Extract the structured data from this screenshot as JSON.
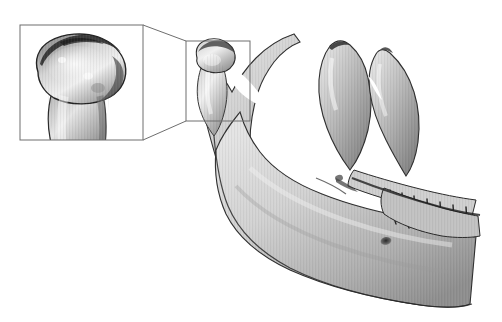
{
  "figure": {
    "background_color": "#ffffff",
    "width": 502,
    "height": 322,
    "has_text_labels": false,
    "caption": ""
  },
  "render_style": {
    "type": "grayscale-3d-surface-render",
    "bone_light": "#e8e8e8",
    "bone_mid": "#b9b9b9",
    "bone_shadow": "#7d7d7d",
    "bone_dark": "#3a3a3a",
    "outline_color": "#2b2b2b",
    "striping_artifact": true,
    "striping_description": "fine vertical scan-line banding across the bone surface"
  },
  "callout": {
    "name": "magnification-callout",
    "line_color": "#6e6e6e",
    "line_width": 1,
    "source_box": {
      "label": "condyle region of interest",
      "x": 186,
      "y": 41,
      "width": 64,
      "height": 80
    },
    "magnified_box": {
      "label": "magnified condylar head",
      "x": 20,
      "y": 25,
      "width": 123,
      "height": 115
    },
    "connector_lines": [
      {
        "from": "magnified-box-top-right",
        "to": "source-box-top-left"
      },
      {
        "from": "magnified-box-bottom-right",
        "to": "source-box-bottom-left"
      }
    ]
  },
  "anatomy": {
    "specimen": "mandible",
    "view": "left lateral oblique",
    "structures": [
      {
        "name": "condylar-head",
        "note": "irregular eroded superior articular surface"
      },
      {
        "name": "condylar-neck"
      },
      {
        "name": "mandibular-notch"
      },
      {
        "name": "coronoid-process"
      },
      {
        "name": "ramus"
      },
      {
        "name": "gonial-angle"
      },
      {
        "name": "body-of-mandible"
      },
      {
        "name": "mental-foramen"
      },
      {
        "name": "alveolar-ridge"
      },
      {
        "name": "teeth"
      }
    ]
  }
}
